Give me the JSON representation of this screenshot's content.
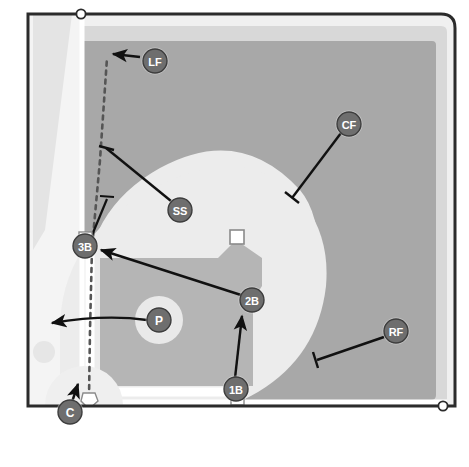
{
  "diagram": {
    "kind": "baseball-field-play-diagram",
    "width": 469,
    "height": 467
  },
  "colors": {
    "outfield_grass": "#a9a9a9",
    "infield_grass": "#b4b4b4",
    "dirt": "#e8e8e8",
    "warning_track": "#d6d6d6",
    "foul_territory": "#f2f2f2",
    "foul_line": "#ffffff",
    "border": "#2b2b2b",
    "marker_fill": "#6e6e6e",
    "marker_stroke": "#3a3a3a",
    "marker_text": "#ffffff",
    "arrow": "#111111",
    "base_white": "#ffffff",
    "base_outline": "#8a8a8a",
    "page_background": "#ffffff",
    "dashed_path": "#4a4a4a"
  },
  "positions": [
    {
      "id": "lf",
      "label": "LF",
      "name": "left-fielder",
      "x": 155,
      "y": 61,
      "r": 13
    },
    {
      "id": "cf",
      "label": "CF",
      "name": "center-fielder",
      "x": 349,
      "y": 124,
      "r": 13
    },
    {
      "id": "rf",
      "label": "RF",
      "name": "right-fielder",
      "x": 396,
      "y": 331,
      "r": 13
    },
    {
      "id": "ss",
      "label": "SS",
      "name": "shortstop",
      "x": 180,
      "y": 210,
      "r": 13
    },
    {
      "id": "2b",
      "label": "2B",
      "name": "second-baseman",
      "x": 252,
      "y": 300,
      "r": 13
    },
    {
      "id": "3b",
      "label": "3B",
      "name": "third-baseman",
      "x": 85,
      "y": 246,
      "r": 13
    },
    {
      "id": "1b",
      "label": "1B",
      "name": "first-baseman",
      "x": 236,
      "y": 389,
      "r": 13
    },
    {
      "id": "p",
      "label": "P",
      "name": "pitcher",
      "x": 159,
      "y": 320,
      "r": 13
    },
    {
      "id": "c",
      "label": "C",
      "name": "catcher",
      "x": 70,
      "y": 412,
      "r": 13
    }
  ],
  "bases": [
    {
      "id": "first-base",
      "name": "first-base-bag",
      "x": 237,
      "y": 399,
      "size": 13,
      "shape": "square"
    },
    {
      "id": "second-base",
      "name": "second-base-bag",
      "x": 237,
      "y": 237,
      "size": 14,
      "shape": "square"
    },
    {
      "id": "third-base",
      "name": "third-base-bag",
      "x": 85,
      "y": 238,
      "size": 13,
      "shape": "square"
    },
    {
      "id": "home-plate",
      "name": "home-plate",
      "x": 88,
      "y": 400,
      "size": 13,
      "shape": "pentagon"
    }
  ],
  "movement_arrows": [
    {
      "id": "lf-arrow",
      "name": "lf-movement-arrow",
      "from_label": "LF",
      "description": "left fielder moves left toward foul line"
    },
    {
      "id": "cf-arrow",
      "name": "cf-movement-arrow",
      "from_label": "CF",
      "description": "center fielder moves in toward left-center gap"
    },
    {
      "id": "rf-arrow",
      "name": "rf-movement-arrow",
      "from_label": "RF",
      "description": "right fielder moves in toward right-center"
    },
    {
      "id": "ss-arrow",
      "name": "ss-movement-arrow",
      "from_label": "SS",
      "description": "shortstop moves up left field line"
    },
    {
      "id": "2b-arrow",
      "name": "second-baseman-movement-arrow",
      "from_label": "2B",
      "description": "second baseman moves to third base"
    },
    {
      "id": "1b-arrow",
      "name": "first-baseman-movement-arrow",
      "from_label": "1B",
      "description": "first baseman charges toward the mound"
    },
    {
      "id": "p-arrow",
      "name": "pitcher-movement-arrow",
      "from_label": "P",
      "description": "pitcher breaks left toward foul territory"
    },
    {
      "id": "c-arrow",
      "name": "catcher-movement-arrow",
      "from_label": "C",
      "description": "catcher advances up the third base line"
    }
  ],
  "paths": [
    {
      "id": "dashed-baseline",
      "name": "dashed-runner-path",
      "style": "dashed",
      "description": "dashed path from home plate up the third base line into left field"
    }
  ],
  "field_markers": [
    {
      "id": "left-pole",
      "name": "left-foul-pole-marker",
      "x": 81,
      "y": 14
    },
    {
      "id": "right-pole",
      "name": "right-foul-pole-marker",
      "x": 442,
      "y": 406
    }
  ],
  "mound_circles": [
    {
      "id": "mound",
      "name": "pitchers-mound",
      "x": 159,
      "y": 320,
      "r": 22
    },
    {
      "id": "home-circle",
      "name": "home-plate-circle",
      "x": 84,
      "y": 405,
      "r": 38
    },
    {
      "id": "on-deck-left",
      "name": "on-deck-circle-left",
      "x": 44,
      "y": 352,
      "r": 10
    },
    {
      "id": "on-deck-right",
      "name": "on-deck-circle-right",
      "x": 124,
      "y": 428,
      "r": 10
    }
  ]
}
